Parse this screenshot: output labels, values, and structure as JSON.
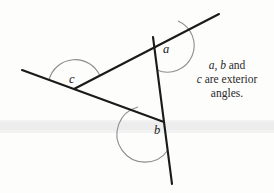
{
  "figure": {
    "background_color": "#fdfdfc",
    "line_color": "#1a1a1a",
    "arc_color": "#8d8d8d",
    "band_color": "#eeeeee",
    "labels": {
      "a": "a",
      "b": "b",
      "c": "c"
    },
    "caption": {
      "line1_var1": "a",
      "line1_sep": ", ",
      "line1_var2": "b",
      "line1_tail": " and",
      "line2_var": "c",
      "line2_tail": " are exterior",
      "line3": "angles."
    },
    "geometry": {
      "vertices": {
        "top": {
          "x": 155,
          "y": 44
        },
        "left": {
          "x": 74,
          "y": 89
        },
        "bottom": {
          "x": 164,
          "y": 122
        }
      },
      "rays": {
        "upper_right_end": {
          "x": 219,
          "y": 14
        },
        "left_end": {
          "x": 22,
          "y": 70
        },
        "lower_end": {
          "x": 172,
          "y": 184
        }
      },
      "scan_band": {
        "y": 121,
        "height": 11
      }
    }
  }
}
